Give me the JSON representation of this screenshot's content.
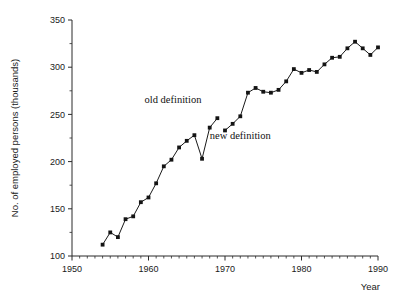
{
  "chart_data": {
    "type": "line",
    "title": "",
    "xlabel": "Year",
    "ylabel": "No. of employed persons (thousands)",
    "xlim": [
      1950,
      1990
    ],
    "ylim": [
      100,
      350
    ],
    "grid": false,
    "legend_position": "none",
    "x_major_ticks": [
      1950,
      1960,
      1970,
      1980,
      1990
    ],
    "x_tick_labels": [
      "1950",
      "1960",
      "1970",
      "1980",
      "1990"
    ],
    "x_minor_tick_step": 1,
    "y_major_ticks": [
      100,
      150,
      200,
      250,
      300,
      350
    ],
    "y_tick_labels": [
      "100",
      "150",
      "200",
      "250",
      "300",
      "350"
    ],
    "y_minor_tick_step": 25,
    "marker": "square",
    "series": [
      {
        "name": "old definition",
        "x": [
          1954,
          1955,
          1956,
          1957,
          1958,
          1959,
          1960,
          1961,
          1962,
          1963,
          1964,
          1965,
          1966,
          1967,
          1968,
          1969
        ],
        "values": [
          112,
          125,
          120,
          139,
          142,
          157,
          162,
          177,
          195,
          202,
          215,
          222,
          228,
          203,
          236,
          246
        ]
      },
      {
        "name": "new definition",
        "x": [
          1970,
          1971,
          1972,
          1973,
          1974,
          1975,
          1976,
          1977,
          1978,
          1979,
          1980,
          1981,
          1982,
          1983,
          1984,
          1985,
          1986,
          1987,
          1988,
          1989,
          1990
        ],
        "values": [
          233,
          240,
          248,
          273,
          278,
          274,
          273,
          276,
          285,
          298,
          294,
          297,
          295,
          303,
          310,
          311,
          320,
          327,
          320,
          313,
          321
        ]
      }
    ],
    "annotations": [
      {
        "text": "old definition",
        "x": 1963.2,
        "y": 262,
        "anchor": "middle"
      },
      {
        "text": "new definition",
        "x": 1972.0,
        "y": 224,
        "anchor": "middle"
      }
    ]
  },
  "colors": {
    "line": "#1a1a1a",
    "marker": "#141414",
    "axis": "#2b2b2b",
    "text": "#1a1a1a",
    "background": "#ffffff"
  }
}
